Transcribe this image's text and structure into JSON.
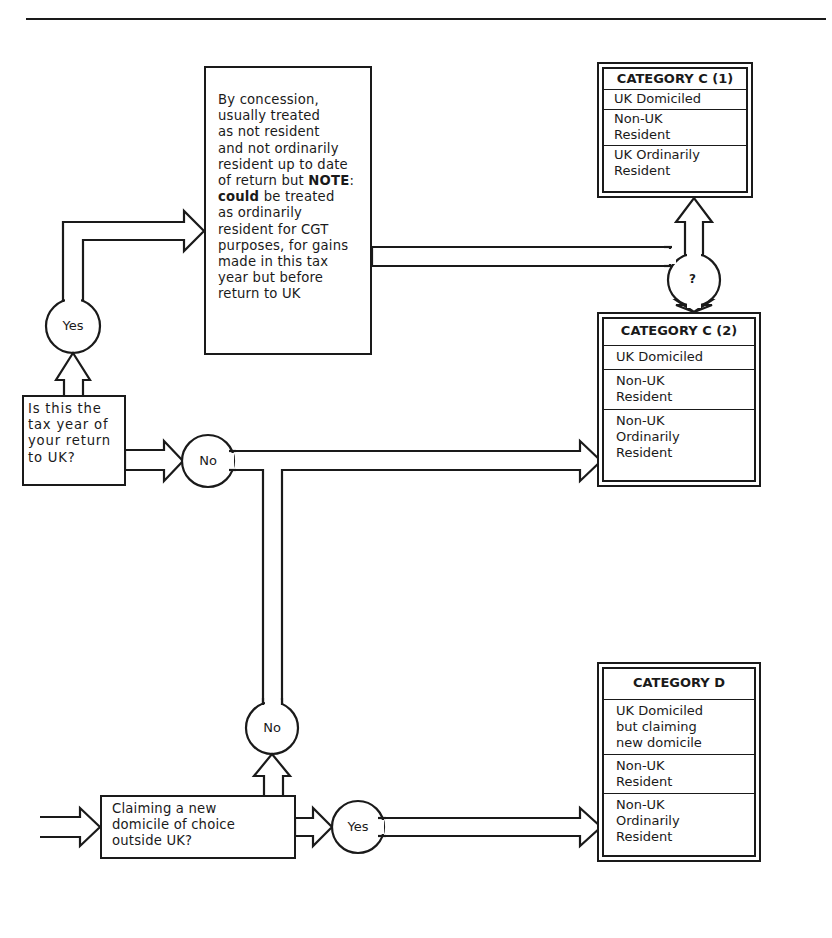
{
  "diagram": {
    "type": "flowchart",
    "note_box": {
      "line1": "By concession,",
      "line2": "usually treated",
      "line3": "as not resident",
      "line4": "and not ordinarily",
      "line5": "resident up to date",
      "line6_pre": "of return but ",
      "line6_bold": "NOTE",
      "line6_post": ":",
      "line7_bold": "could",
      "line7_post": " be treated",
      "line8": "as ordinarily",
      "line9": "resident for CGT",
      "line10": "purposes, for gains",
      "line11": "made in this tax",
      "line12": "year but before",
      "line13": "return to UK"
    },
    "question_1": {
      "lines": [
        "Is this the",
        "tax year of",
        "your return",
        "to UK?"
      ]
    },
    "question_2": {
      "lines": [
        "Claiming a new",
        "domicile of choice",
        "outside UK?"
      ]
    },
    "decisions": {
      "q1_yes": "Yes",
      "q1_no": "No",
      "q2_no": "No",
      "q2_yes": "Yes",
      "uncertain": "?"
    },
    "categories": [
      {
        "title": "CATEGORY C (1)",
        "rows": [
          {
            "lines": [
              "UK Domiciled"
            ]
          },
          {
            "lines": [
              "Non-UK",
              "Resident"
            ]
          },
          {
            "lines": [
              "UK Ordinarily",
              "Resident"
            ]
          }
        ]
      },
      {
        "title": "CATEGORY C (2)",
        "rows": [
          {
            "lines": [
              "UK Domiciled"
            ]
          },
          {
            "lines": [
              "Non-UK",
              "Resident"
            ]
          },
          {
            "lines": [
              "Non-UK",
              "Ordinarily",
              "Resident"
            ]
          }
        ]
      },
      {
        "title": "CATEGORY D",
        "rows": [
          {
            "lines": [
              "UK Domiciled",
              "but claiming",
              "new domicile"
            ]
          },
          {
            "lines": [
              "Non-UK",
              "Resident"
            ]
          },
          {
            "lines": [
              "Non-UK",
              "Ordinarily",
              "Resident"
            ]
          }
        ]
      }
    ],
    "colors": {
      "ink": "#1a1a1a",
      "paper": "#ffffff"
    }
  }
}
